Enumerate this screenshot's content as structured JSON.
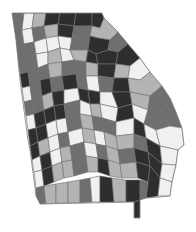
{
  "map": {
    "region": "Georgia",
    "type": "choropleth",
    "subdivision": "counties",
    "palette": {
      "very_dark": "#2e2e2e",
      "dark": "#6f6f6f",
      "light": "#b4b4b4",
      "very_light": "#f0f0f0",
      "border": "#6e6e6e"
    },
    "outline": "12,13 102,13 104,18 118,32 128,44 140,58 150,72 162,86 170,98 176,112 182,128 184,145 178,150 176,165 172,182 170,196 146,198 140,200 140,218 134,218 134,202 40,204 36,196 34,180 30,150 28,140 24,110 20,80 16,40",
    "counties": [
      {
        "points": "12,13 24,13 22,30 14,30",
        "shade": "dark"
      },
      {
        "points": "24,13 34,13 32,28 22,30",
        "shade": "very_light"
      },
      {
        "points": "34,13 46,13 44,26 32,28",
        "shade": "light"
      },
      {
        "points": "46,13 60,13 58,24 44,26",
        "shade": "very_dark"
      },
      {
        "points": "60,13 76,13 74,26 58,24",
        "shade": "very_dark"
      },
      {
        "points": "76,13 92,13 92,26 74,26",
        "shade": "very_dark"
      },
      {
        "points": "92,13 102,13 104,18 100,28 92,26",
        "shade": "very_dark"
      },
      {
        "points": "14,30 22,30 24,44 16,44",
        "shade": "dark"
      },
      {
        "points": "22,30 32,28 34,42 24,44",
        "shade": "very_light"
      },
      {
        "points": "32,28 44,26 46,38 34,42",
        "shade": "dark"
      },
      {
        "points": "44,26 58,24 58,36 46,38",
        "shade": "light"
      },
      {
        "points": "58,24 74,26 72,38 58,36",
        "shade": "very_dark"
      },
      {
        "points": "74,26 92,26 90,36 72,38",
        "shade": "dark"
      },
      {
        "points": "92,26 100,28 104,18 118,32 110,40 98,38 90,36",
        "shade": "light"
      },
      {
        "points": "16,44 24,44 26,58 18,60",
        "shade": "dark"
      },
      {
        "points": "24,44 34,42 36,54 26,58",
        "shade": "dark"
      },
      {
        "points": "34,42 46,38 48,52 36,54",
        "shade": "very_light"
      },
      {
        "points": "46,38 58,36 60,48 48,52",
        "shade": "very_light"
      },
      {
        "points": "58,36 72,38 70,50 60,48",
        "shade": "very_light"
      },
      {
        "points": "72,38 90,36 88,50 70,50",
        "shade": "dark"
      },
      {
        "points": "90,36 98,38 110,40 108,50 96,54 88,50",
        "shade": "very_dark"
      },
      {
        "points": "110,40 118,32 128,44 118,52 108,50",
        "shade": "dark"
      },
      {
        "points": "18,60 26,58 28,72 20,74",
        "shade": "dark"
      },
      {
        "points": "26,58 36,54 38,68 28,72",
        "shade": "dark"
      },
      {
        "points": "36,54 48,52 48,64 38,68",
        "shade": "very_light"
      },
      {
        "points": "48,52 60,48 62,62 48,64",
        "shade": "light"
      },
      {
        "points": "60,48 70,50 74,60 62,62",
        "shade": "very_light"
      },
      {
        "points": "70,50 88,50 86,62 74,60",
        "shade": "light"
      },
      {
        "points": "88,50 96,54 98,64 86,62",
        "shade": "very_dark"
      },
      {
        "points": "96,54 108,50 118,52 116,64 98,64",
        "shade": "very_dark"
      },
      {
        "points": "118,52 128,44 140,58 130,66 116,64",
        "shade": "very_dark"
      },
      {
        "points": "20,74 28,72 30,86 22,88",
        "shade": "very_dark"
      },
      {
        "points": "28,72 38,68 40,80 30,86",
        "shade": "dark"
      },
      {
        "points": "38,68 48,64 50,78 40,80",
        "shade": "dark"
      },
      {
        "points": "48,64 62,62 62,76 50,78",
        "shade": "light"
      },
      {
        "points": "62,62 74,60 76,74 62,76",
        "shade": "dark"
      },
      {
        "points": "74,60 86,62 86,76 76,74",
        "shade": "dark"
      },
      {
        "points": "86,62 98,64 98,76 86,76",
        "shade": "light"
      },
      {
        "points": "98,64 116,64 114,78 98,76",
        "shade": "very_dark"
      },
      {
        "points": "116,64 130,66 128,78 114,78",
        "shade": "light"
      },
      {
        "points": "130,66 140,58 150,72 140,80 128,78",
        "shade": "very_light"
      },
      {
        "points": "22,88 30,86 32,100 24,102",
        "shade": "very_light"
      },
      {
        "points": "30,86 40,80 42,96 32,100",
        "shade": "dark"
      },
      {
        "points": "40,80 50,78 52,92 42,96",
        "shade": "very_dark"
      },
      {
        "points": "50,78 62,76 64,90 52,92",
        "shade": "dark"
      },
      {
        "points": "62,76 76,74 78,88 64,90",
        "shade": "very_dark"
      },
      {
        "points": "76,74 86,76 88,90 78,88",
        "shade": "dark"
      },
      {
        "points": "86,76 98,76 100,92 88,90",
        "shade": "very_light"
      },
      {
        "points": "98,76 114,78 112,92 100,92",
        "shade": "dark"
      },
      {
        "points": "114,78 128,78 130,92 112,92",
        "shade": "very_dark"
      },
      {
        "points": "128,78 140,80 150,72 162,86 150,96 130,92",
        "shade": "light"
      },
      {
        "points": "24,102 32,100 34,114 26,116",
        "shade": "dark"
      },
      {
        "points": "32,100 42,96 44,110 34,114",
        "shade": "dark"
      },
      {
        "points": "42,96 52,92 54,106 44,110",
        "shade": "light"
      },
      {
        "points": "52,92 64,90 64,104 54,106",
        "shade": "very_dark"
      },
      {
        "points": "64,90 78,88 80,100 64,104",
        "shade": "very_light"
      },
      {
        "points": "78,88 88,90 90,104 80,100",
        "shade": "very_dark"
      },
      {
        "points": "88,90 100,92 100,104 90,104",
        "shade": "very_dark"
      },
      {
        "points": "100,92 112,92 118,108 100,104",
        "shade": "very_light"
      },
      {
        "points": "112,92 130,92 132,104 118,108",
        "shade": "very_dark"
      },
      {
        "points": "130,92 150,96 148,110 132,104",
        "shade": "light"
      },
      {
        "points": "150,96 162,86 170,98 164,112 148,110",
        "shade": "dark"
      },
      {
        "points": "26,116 34,114 36,128 28,130",
        "shade": "very_light"
      },
      {
        "points": "34,114 44,110 46,124 36,128",
        "shade": "very_dark"
      },
      {
        "points": "44,110 54,106 56,120 46,124",
        "shade": "very_dark"
      },
      {
        "points": "54,106 64,104 66,118 56,120",
        "shade": "very_dark"
      },
      {
        "points": "64,104 80,100 80,114 66,118",
        "shade": "dark"
      },
      {
        "points": "80,100 90,104 92,116 80,114",
        "shade": "very_light"
      },
      {
        "points": "90,104 100,104 102,118 92,116",
        "shade": "light"
      },
      {
        "points": "100,104 118,108 116,122 102,118",
        "shade": "very_light"
      },
      {
        "points": "118,108 132,104 134,118 116,122",
        "shade": "very_dark"
      },
      {
        "points": "132,104 148,110 144,124 134,118",
        "shade": "very_light"
      },
      {
        "points": "148,110 164,112 170,126 156,130 144,124",
        "shade": "dark"
      },
      {
        "points": "164,112 170,98 176,112 182,128 170,126",
        "shade": "dark"
      },
      {
        "points": "28,130 36,128 38,142 30,146",
        "shade": "very_dark"
      },
      {
        "points": "36,128 46,124 48,138 38,142",
        "shade": "very_dark"
      },
      {
        "points": "46,124 56,120 58,134 48,138",
        "shade": "very_light"
      },
      {
        "points": "56,120 66,118 68,132 58,134",
        "shade": "very_light"
      },
      {
        "points": "66,118 80,114 82,128 68,132",
        "shade": "dark"
      },
      {
        "points": "80,114 92,116 94,130 82,128",
        "shade": "light"
      },
      {
        "points": "92,116 102,118 104,132 94,130",
        "shade": "dark"
      },
      {
        "points": "102,118 116,122 116,136 104,132",
        "shade": "dark"
      },
      {
        "points": "116,122 134,118 134,134 116,136",
        "shade": "very_light"
      },
      {
        "points": "134,118 144,124 146,138 134,134",
        "shade": "very_dark"
      },
      {
        "points": "144,124 156,130 160,146 146,138",
        "shade": "very_light"
      },
      {
        "points": "156,130 170,126 182,128 184,145 178,150 160,146",
        "shade": "very_light"
      },
      {
        "points": "30,146 38,142 40,156 32,160",
        "shade": "very_dark"
      },
      {
        "points": "38,142 48,138 50,152 40,156",
        "shade": "light"
      },
      {
        "points": "48,138 58,134 60,148 50,152",
        "shade": "very_light"
      },
      {
        "points": "58,134 68,132 70,146 60,148",
        "shade": "dark"
      },
      {
        "points": "68,132 82,128 84,142 70,146",
        "shade": "very_light"
      },
      {
        "points": "82,128 94,130 96,144 84,142",
        "shade": "light"
      },
      {
        "points": "94,130 104,132 106,146 96,144",
        "shade": "very_light"
      },
      {
        "points": "104,132 116,136 118,150 106,146",
        "shade": "light"
      },
      {
        "points": "116,136 134,134 134,148 118,150",
        "shade": "light"
      },
      {
        "points": "134,134 146,138 148,152 134,148",
        "shade": "dark"
      },
      {
        "points": "146,138 160,146 162,164 148,152",
        "shade": "very_dark"
      },
      {
        "points": "160,146 178,150 176,165 162,164",
        "shade": "very_light"
      },
      {
        "points": "32,160 40,156 42,170 34,172",
        "shade": "very_light"
      },
      {
        "points": "40,156 50,152 52,166 42,170",
        "shade": "very_dark"
      },
      {
        "points": "50,152 60,148 62,162 52,166",
        "shade": "very_light"
      },
      {
        "points": "60,148 70,146 72,160 62,162",
        "shade": "light"
      },
      {
        "points": "70,146 84,142 86,156 72,160",
        "shade": "dark"
      },
      {
        "points": "84,142 96,144 98,158 86,156",
        "shade": "very_light"
      },
      {
        "points": "96,144 106,146 108,160 98,158",
        "shade": "dark"
      },
      {
        "points": "106,146 118,150 120,164 108,160",
        "shade": "light"
      },
      {
        "points": "118,150 134,148 136,162 120,164",
        "shade": "dark"
      },
      {
        "points": "134,148 148,152 150,166 136,162",
        "shade": "very_dark"
      },
      {
        "points": "148,152 162,164 160,178 150,166",
        "shade": "very_dark"
      },
      {
        "points": "162,164 176,165 172,182 160,178",
        "shade": "very_light"
      },
      {
        "points": "34,172 42,170 44,186 36,188",
        "shade": "very_light"
      },
      {
        "points": "42,170 52,166 54,182 44,186",
        "shade": "very_dark"
      },
      {
        "points": "52,166 62,162 64,178 54,182",
        "shade": "light"
      },
      {
        "points": "62,162 72,160 74,176 64,178",
        "shade": "light"
      },
      {
        "points": "72,160 86,156 88,172 74,176",
        "shade": "dark"
      },
      {
        "points": "86,156 98,158 98,172 88,172",
        "shade": "light"
      },
      {
        "points": "98,158 108,160 110,176 98,172",
        "shade": "very_dark"
      },
      {
        "points": "108,160 120,164 122,178 110,176",
        "shade": "light"
      },
      {
        "points": "120,164 136,162 138,178 122,178",
        "shade": "light"
      },
      {
        "points": "136,162 150,166 148,182 138,178",
        "shade": "very_dark"
      },
      {
        "points": "150,166 160,178 158,196 146,198 148,182",
        "shade": "very_dark"
      },
      {
        "points": "160,178 172,182 170,196 158,196",
        "shade": "very_light"
      },
      {
        "points": "36,188 44,186 46,204 40,204 36,196",
        "shade": "dark"
      },
      {
        "points": "44,186 56,184 56,203 46,204",
        "shade": "light"
      },
      {
        "points": "56,184 68,182 68,203 56,203",
        "shade": "light"
      },
      {
        "points": "68,182 80,180 80,203 68,203",
        "shade": "light"
      },
      {
        "points": "80,180 90,178 92,202 80,203",
        "shade": "dark"
      },
      {
        "points": "90,178 100,176 100,202 92,202",
        "shade": "very_light"
      },
      {
        "points": "100,176 112,178 114,202 100,202",
        "shade": "very_dark"
      },
      {
        "points": "112,178 126,180 126,202 114,202",
        "shade": "light"
      },
      {
        "points": "126,180 140,180 140,200 134,202 126,202",
        "shade": "very_dark"
      },
      {
        "points": "140,180 148,182 146,198 140,200",
        "shade": "dark"
      },
      {
        "points": "134,202 140,200 140,218 134,218",
        "shade": "very_dark"
      }
    ]
  }
}
